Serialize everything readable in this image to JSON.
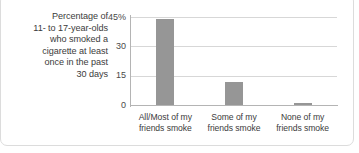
{
  "caption": {
    "lines": [
      "Percentage of",
      "11- to 17-year-olds",
      "who smoked a",
      "cigarette at least",
      "once in the past",
      "30 days"
    ]
  },
  "colors": {
    "bar": "#969696",
    "axis": "#b4b4b4",
    "gridline": "#d7d7d7",
    "text": "#3b3b3b",
    "frame": "#dcdcdc",
    "background": "#ffffff"
  },
  "axis": {
    "y_ticks": [
      {
        "label": "45%",
        "value": 45
      },
      {
        "label": "30",
        "value": 30
      },
      {
        "label": "15",
        "value": 15
      },
      {
        "label": "0",
        "value": 0
      }
    ]
  },
  "chart_data": {
    "type": "bar",
    "title": "Percentage of 11- to 17-year-olds who smoked a cigarette at least once in the past 30 days",
    "categories": [
      "All/Most of my friends smoke",
      "Some of my friends smoke",
      "None of my friends smoke"
    ],
    "category_lines": [
      [
        "All/Most of my",
        "friends smoke"
      ],
      [
        "Some of my",
        "friends smoke"
      ],
      [
        "None of my",
        "friends smoke"
      ]
    ],
    "values": [
      44,
      12,
      1
    ],
    "xlabel": "",
    "ylabel": "",
    "ylim": [
      0,
      45
    ],
    "yticks": [
      0,
      15,
      30,
      45
    ],
    "ytick_labels": [
      "0",
      "15",
      "30",
      "45%"
    ],
    "grid": true,
    "legend": false
  }
}
